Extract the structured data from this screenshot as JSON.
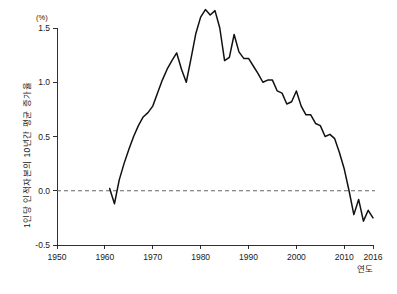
{
  "chart_data": {
    "type": "line",
    "title": "",
    "subtitle": "",
    "xlabel": "연도",
    "ylabel": "1인당 인적자본의 10년간 평균 증가율",
    "yunit": "(%)",
    "xlim": [
      1950,
      2016
    ],
    "ylim": [
      -0.5,
      1.5
    ],
    "grid": false,
    "legend": null,
    "xticks": [
      "1950",
      "1960",
      "1970",
      "1980",
      "1990",
      "2000",
      "2010",
      "2016"
    ],
    "xtick_values": [
      1950,
      1960,
      1970,
      1980,
      1990,
      2000,
      2010,
      2016
    ],
    "yticks": [
      "1.5",
      "1.0",
      "0.5",
      "0.0",
      "-0.5"
    ],
    "ytick_values": [
      1.5,
      1.0,
      0.5,
      0.0,
      -0.5
    ],
    "annotations": [
      {
        "name": "zero-reference-line",
        "y": 0.0,
        "style": "dashed"
      }
    ],
    "series": [
      {
        "name": "1인당 인적자본의 10년간 평균 증가율",
        "x": [
          1961,
          1962,
          1963,
          1964,
          1965,
          1966,
          1967,
          1968,
          1969,
          1970,
          1971,
          1972,
          1973,
          1974,
          1975,
          1976,
          1977,
          1978,
          1979,
          1980,
          1981,
          1982,
          1983,
          1984,
          1985,
          1986,
          1987,
          1988,
          1989,
          1990,
          1991,
          1992,
          1993,
          1994,
          1995,
          1996,
          1997,
          1998,
          1999,
          2000,
          2001,
          2002,
          2003,
          2004,
          2005,
          2006,
          2007,
          2008,
          2009,
          2010,
          2011,
          2012,
          2013,
          2014,
          2015,
          2016
        ],
        "values": [
          0.02,
          -0.12,
          0.1,
          0.25,
          0.38,
          0.5,
          0.6,
          0.68,
          0.72,
          0.78,
          0.9,
          1.02,
          1.12,
          1.2,
          1.27,
          1.12,
          1.0,
          1.22,
          1.45,
          1.6,
          1.67,
          1.62,
          1.66,
          1.5,
          1.2,
          1.23,
          1.44,
          1.28,
          1.22,
          1.22,
          1.15,
          1.08,
          1.0,
          1.02,
          1.02,
          0.92,
          0.9,
          0.8,
          0.82,
          0.92,
          0.78,
          0.7,
          0.7,
          0.62,
          0.6,
          0.5,
          0.52,
          0.48,
          0.35,
          0.2,
          0.0,
          -0.22,
          -0.08,
          -0.28,
          -0.18,
          -0.25
        ]
      }
    ]
  },
  "axes": {
    "y_unit_label": "(%)",
    "y_axis_title": "1인당 인적자본의 10년간 평균 증가율",
    "x_axis_title": "연도"
  }
}
